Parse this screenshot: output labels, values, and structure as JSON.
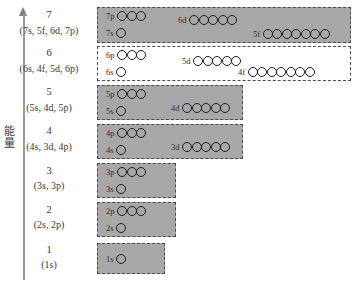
{
  "axis": {
    "label_chars": [
      "能",
      "量"
    ],
    "label_text": "能量",
    "arrow_icon": "up-arrow-icon",
    "direction": "up"
  },
  "diagram": {
    "title": "",
    "circle_meaning": "orbital",
    "colors": {
      "filled_box": "#a8a8a8",
      "open_box": "#ffffff",
      "box_border": "#4d4d4d",
      "circle_stroke": "#1f1f1f",
      "axis": "#9a9a9a",
      "text": "#3a3a3a"
    },
    "shells": [
      {
        "number": "7",
        "subshell_list": "(7s, 5f, 6d, 7p)",
        "box_style": "filled",
        "box": {
          "left": 97,
          "top": 7,
          "width": 254,
          "height": 36
        },
        "orbitals": [
          {
            "tag": "7p",
            "count": 3,
            "left": 8,
            "top": 3,
            "row": "upper"
          },
          {
            "tag": "6d",
            "count": 5,
            "left": 80,
            "top": 7,
            "row": "upper"
          },
          {
            "tag": "7s",
            "count": 1,
            "left": 8,
            "top": 20,
            "row": "lower"
          },
          {
            "tag": "5f",
            "count": 7,
            "left": 155,
            "top": 21,
            "row": "lower"
          }
        ]
      },
      {
        "number": "6",
        "subshell_list": "(6s, 4f, 5d, 6p)",
        "box_style": "open",
        "box": {
          "left": 97,
          "top": 46,
          "width": 254,
          "height": 35
        },
        "orbitals": [
          {
            "tag": "6p",
            "count": 3,
            "left": 8,
            "top": 3,
            "row": "upper"
          },
          {
            "tag": "5d",
            "count": 5,
            "left": 84,
            "top": 9,
            "row": "upper"
          },
          {
            "tag": "6s",
            "count": 1,
            "left": 8,
            "top": 20,
            "row": "lower"
          },
          {
            "tag": "4f",
            "count": 7,
            "left": 140,
            "top": 20,
            "row": "lower"
          }
        ]
      },
      {
        "number": "5",
        "subshell_list": "(5s, 4d, 5p)",
        "box_style": "filled",
        "box": {
          "left": 97,
          "top": 85,
          "width": 146,
          "height": 35
        },
        "orbitals": [
          {
            "tag": "5p",
            "count": 3,
            "left": 8,
            "top": 3,
            "row": "upper"
          },
          {
            "tag": "4d",
            "count": 5,
            "left": 73,
            "top": 17,
            "row": "lower"
          },
          {
            "tag": "5s",
            "count": 1,
            "left": 8,
            "top": 20,
            "row": "lower"
          }
        ]
      },
      {
        "number": "4",
        "subshell_list": "(4s, 3d, 4p)",
        "box_style": "filled",
        "box": {
          "left": 97,
          "top": 124,
          "width": 146,
          "height": 35
        },
        "orbitals": [
          {
            "tag": "4p",
            "count": 3,
            "left": 8,
            "top": 3,
            "row": "upper"
          },
          {
            "tag": "3d",
            "count": 5,
            "left": 73,
            "top": 17,
            "row": "lower"
          },
          {
            "tag": "4s",
            "count": 1,
            "left": 8,
            "top": 20,
            "row": "lower"
          }
        ]
      },
      {
        "number": "3",
        "subshell_list": "(3s, 3p)",
        "box_style": "filled",
        "box": {
          "left": 97,
          "top": 163,
          "width": 79,
          "height": 35
        },
        "orbitals": [
          {
            "tag": "3p",
            "count": 3,
            "left": 8,
            "top": 3,
            "row": "upper"
          },
          {
            "tag": "3s",
            "count": 1,
            "left": 8,
            "top": 20,
            "row": "lower"
          }
        ]
      },
      {
        "number": "2",
        "subshell_list": "(2s, 2p)",
        "box_style": "filled",
        "box": {
          "left": 97,
          "top": 202,
          "width": 79,
          "height": 35
        },
        "orbitals": [
          {
            "tag": "2p",
            "count": 3,
            "left": 8,
            "top": 3,
            "row": "upper"
          },
          {
            "tag": "2s",
            "count": 1,
            "left": 8,
            "top": 20,
            "row": "lower"
          }
        ]
      },
      {
        "number": "1",
        "subshell_list": "(1s)",
        "box_style": "filled",
        "box": {
          "left": 97,
          "top": 243,
          "width": 68,
          "height": 31
        },
        "orbitals": [
          {
            "tag": "1s",
            "count": 1,
            "left": 8,
            "top": 10,
            "row": "single"
          }
        ]
      }
    ],
    "label_positions": [
      {
        "num_top": 9,
        "sub_top": 25
      },
      {
        "num_top": 47,
        "sub_top": 63
      },
      {
        "num_top": 86,
        "sub_top": 102
      },
      {
        "num_top": 125,
        "sub_top": 141
      },
      {
        "num_top": 165,
        "sub_top": 180
      },
      {
        "num_top": 204,
        "sub_top": 219
      },
      {
        "num_top": 244,
        "sub_top": 259
      }
    ]
  }
}
